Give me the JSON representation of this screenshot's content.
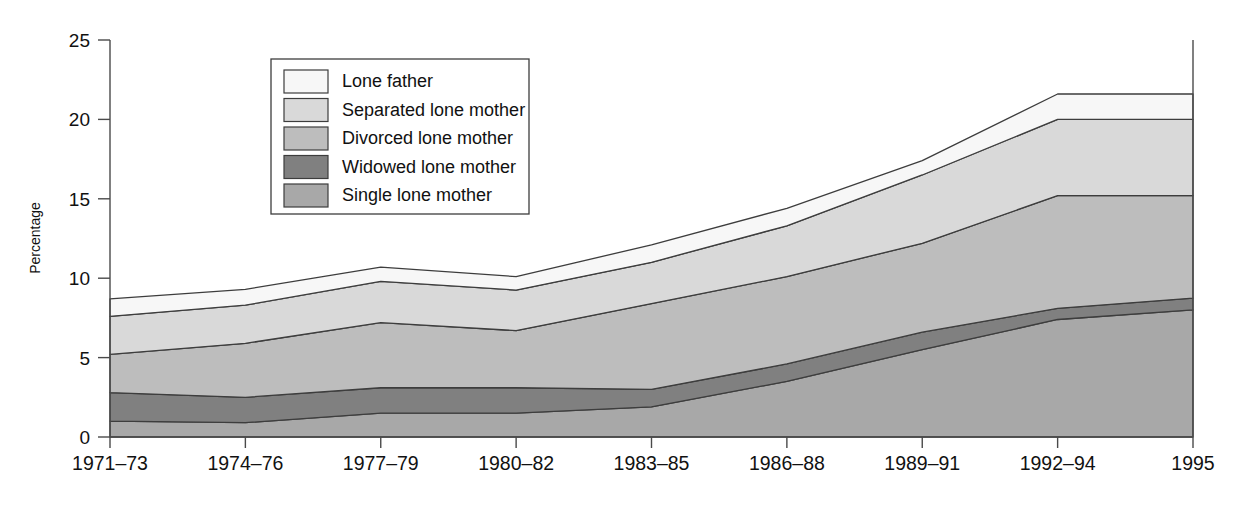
{
  "chart_data": {
    "type": "area",
    "title": "",
    "xlabel": "",
    "ylabel": "Percentage",
    "ylim": [
      0,
      25
    ],
    "yticks": [
      0,
      5,
      10,
      15,
      20,
      25
    ],
    "ytick_labels": [
      "0",
      "5",
      "10",
      "15",
      "20",
      "25"
    ],
    "grid": false,
    "stacked": true,
    "legend_position": "top-left-inside",
    "categories": [
      "1971–73",
      "1974–76",
      "1977–79",
      "1980–82",
      "1983–85",
      "1986–88",
      "1989–91",
      "1992–94",
      "1995"
    ],
    "series": [
      {
        "name": "Single lone mother",
        "color": "#a8a8a8",
        "values": [
          1.0,
          0.9,
          1.5,
          1.5,
          1.9,
          3.5,
          5.5,
          7.4,
          8.0
        ]
      },
      {
        "name": "Widowed lone mother",
        "color": "#808080",
        "values": [
          1.8,
          1.6,
          1.6,
          1.6,
          1.1,
          1.1,
          1.1,
          0.7,
          0.75
        ]
      },
      {
        "name": "Divorced lone mother",
        "color": "#bdbdbd",
        "values": [
          2.4,
          3.4,
          4.1,
          3.6,
          5.4,
          5.5,
          5.6,
          7.1,
          6.45
        ]
      },
      {
        "name": "Separated lone mother",
        "color": "#d9d9d9",
        "values": [
          2.4,
          2.4,
          2.6,
          2.55,
          2.6,
          3.2,
          4.3,
          4.8,
          4.8
        ]
      },
      {
        "name": "Lone father",
        "color": "#f7f7f7",
        "values": [
          1.1,
          1.0,
          0.9,
          0.85,
          1.1,
          1.1,
          0.9,
          1.6,
          1.6
        ]
      }
    ],
    "cumulative_tops": {
      "single": [
        1.0,
        0.9,
        1.5,
        1.5,
        1.9,
        3.5,
        5.5,
        7.4,
        8.0
      ],
      "widowed": [
        2.8,
        2.5,
        3.1,
        3.1,
        3.0,
        4.6,
        6.6,
        8.1,
        8.75
      ],
      "divorced": [
        5.2,
        5.9,
        7.2,
        6.7,
        8.4,
        10.1,
        12.2,
        15.2,
        15.2
      ],
      "separated": [
        7.6,
        8.3,
        9.8,
        9.25,
        11.0,
        13.3,
        16.5,
        20.0,
        20.0
      ],
      "lone_father": [
        8.7,
        9.3,
        10.7,
        10.1,
        12.1,
        14.4,
        17.4,
        21.6,
        21.6
      ]
    }
  },
  "legend": {
    "items": [
      {
        "label": "Lone father",
        "color": "#f7f7f7"
      },
      {
        "label": "Separated lone mother",
        "color": "#d9d9d9"
      },
      {
        "label": "Divorced lone mother",
        "color": "#bdbdbd"
      },
      {
        "label": "Widowed lone mother",
        "color": "#808080"
      },
      {
        "label": "Single lone mother",
        "color": "#a8a8a8"
      }
    ]
  },
  "axes": {
    "y_title": "Percentage",
    "y_tick_labels": [
      "25",
      "20",
      "15",
      "10",
      "5",
      "0"
    ],
    "x_tick_labels": [
      "1971–73",
      "1974–76",
      "1977–79",
      "1980–82",
      "1983–85",
      "1986–88",
      "1989–91",
      "1992–94",
      "1995"
    ]
  }
}
